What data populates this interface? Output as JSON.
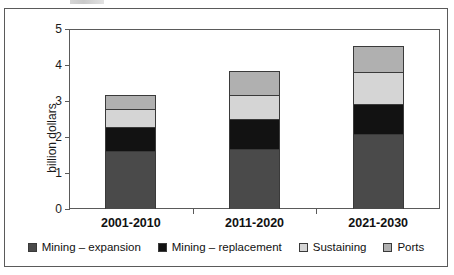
{
  "chart_data": {
    "type": "bar",
    "subtype": "stacked-column",
    "title": "",
    "xlabel": "",
    "ylabel": "billion dollars",
    "ylim": [
      0,
      5
    ],
    "yticks": [
      0,
      1,
      2,
      3,
      4,
      5
    ],
    "ytick_labels": [
      "0",
      "1",
      "2",
      "3",
      "4",
      "5"
    ],
    "grid": false,
    "legend_position": "bottom",
    "categories": [
      "2001-2010",
      "2011-2020",
      "2021-2030"
    ],
    "series": [
      {
        "name": "Mining – expansion",
        "color": "#4a4a4a",
        "values": [
          1.61,
          1.67,
          2.08
        ]
      },
      {
        "name": "Mining – replacement",
        "color": "#121212",
        "values": [
          0.67,
          0.83,
          0.84
        ]
      },
      {
        "name": "Sustaining",
        "color": "#d5d5d5",
        "values": [
          0.5,
          0.67,
          0.89
        ]
      },
      {
        "name": "Ports",
        "color": "#b0b0b0",
        "values": [
          0.39,
          0.66,
          0.72
        ]
      }
    ],
    "totals": [
      3.17,
      3.83,
      4.53
    ]
  },
  "axis": {
    "y_title": "billion dollars",
    "y_ticks": [
      "0",
      "1",
      "2",
      "3",
      "4",
      "5"
    ],
    "x_ticks": [
      "2001-2010",
      "2011-2020",
      "2021-2030"
    ]
  },
  "legend": {
    "items": [
      {
        "label": "Mining – expansion",
        "color": "#4a4a4a"
      },
      {
        "label": "Mining – replacement",
        "color": "#121212"
      },
      {
        "label": "Sustaining",
        "color": "#d5d5d5"
      },
      {
        "label": "Ports",
        "color": "#b0b0b0"
      }
    ]
  },
  "style": {
    "frame_color": "#5a5a5a",
    "text_color": "#111111",
    "background": "#ffffff"
  }
}
